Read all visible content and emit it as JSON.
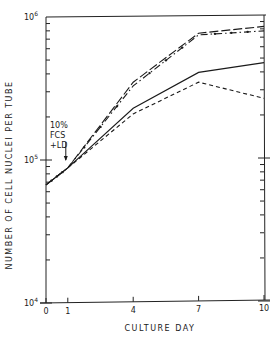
{
  "chart_data": {
    "type": "line",
    "title": "",
    "xlabel": "CULTURE DAY",
    "ylabel": "NUMBER OF CELL NUCLEI PER TUBE",
    "yscale": "log",
    "ylim": [
      10000,
      1000000
    ],
    "xlim": [
      0,
      10
    ],
    "x_ticks": [
      0,
      1,
      4,
      7,
      10
    ],
    "y_tick_labels": [
      {
        "base": "10",
        "exp": "4",
        "value": 10000
      },
      {
        "base": "10",
        "exp": "5",
        "value": 100000
      },
      {
        "base": "10",
        "exp": "6",
        "value": 1000000
      }
    ],
    "grid": false,
    "legend": null,
    "annotation": {
      "lines": [
        "10%",
        "FCS",
        "+LD"
      ],
      "x": 1,
      "note": "arrow pointing down to day 1"
    },
    "series": [
      {
        "name": "long-dash",
        "style": "long-dash",
        "x": [
          0,
          1,
          4,
          7,
          10
        ],
        "values": [
          67000,
          88000,
          350000,
          770000,
          860000
        ]
      },
      {
        "name": "dash-dot",
        "style": "dash-dot",
        "x": [
          0,
          1,
          4,
          7,
          10
        ],
        "values": [
          67000,
          88000,
          330000,
          750000,
          800000
        ]
      },
      {
        "name": "solid",
        "style": "solid",
        "x": [
          0,
          1,
          4,
          7,
          10
        ],
        "values": [
          67000,
          88000,
          230000,
          410000,
          480000
        ]
      },
      {
        "name": "short-dash",
        "style": "short-dash",
        "x": [
          0,
          1,
          4,
          7,
          10
        ],
        "values": [
          67000,
          88000,
          210000,
          350000,
          270000
        ]
      }
    ]
  }
}
